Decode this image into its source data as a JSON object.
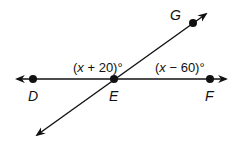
{
  "diagram": {
    "type": "geometry-intersecting-lines",
    "colors": {
      "stroke": "#111111",
      "background": "#ffffff"
    },
    "points": [
      {
        "name": "D",
        "label": "D"
      },
      {
        "name": "E",
        "label": "E"
      },
      {
        "name": "F",
        "label": "F"
      },
      {
        "name": "G",
        "label": "G"
      }
    ],
    "lines": [
      {
        "name": "line-DF",
        "through": [
          "D",
          "E",
          "F"
        ],
        "arrows": "both"
      },
      {
        "name": "line-EG",
        "through": [
          "E",
          "G"
        ],
        "arrows": "both"
      }
    ],
    "angles": [
      {
        "name": "angle-DEG",
        "var": "x",
        "expr": " + 20)°",
        "open": "("
      },
      {
        "name": "angle-GEF",
        "var": "x",
        "expr": " − 60)°",
        "open": "("
      }
    ]
  }
}
